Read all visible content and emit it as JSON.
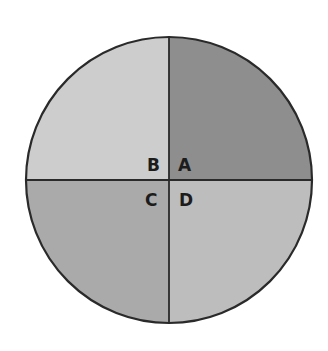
{
  "diagram": {
    "type": "quadrant-circle",
    "center": [
      169,
      180
    ],
    "radius": 143,
    "quadrants": [
      {
        "label": "A",
        "position": "top-right",
        "color": "#8e8e8e"
      },
      {
        "label": "B",
        "position": "top-left",
        "color": "#cdcdcd"
      },
      {
        "label": "C",
        "position": "bottom-left",
        "color": "#aaaaaa"
      },
      {
        "label": "D",
        "position": "bottom-right",
        "color": "#bdbdbd"
      }
    ],
    "line_color": "#2a2a2a"
  }
}
